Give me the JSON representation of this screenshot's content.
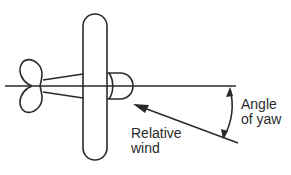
{
  "diagram": {
    "title": "Angle of yaw",
    "labels": {
      "relative_wind": [
        "Relative",
        "wind"
      ],
      "angle_of_yaw": [
        "Angle",
        "of yaw"
      ]
    },
    "colors": {
      "line": "#2a2a2a",
      "background": "#ffffff"
    }
  }
}
